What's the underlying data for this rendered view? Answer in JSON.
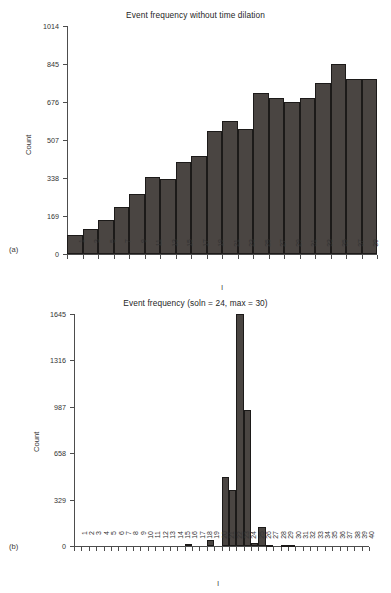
{
  "figure": {
    "background": "#ffffff",
    "bar_color": "#4a4542",
    "bar_edge_color": "#1c1a19",
    "axis_color": "#4d4d4d"
  },
  "panel_a": {
    "label": "(a)",
    "title": "Event frequency without time dilation",
    "xlabel": "l",
    "ylabel": "Count"
  },
  "panel_b": {
    "label": "(b)",
    "title": "Event frequency (soln = 24, max = 30)",
    "xlabel": "l",
    "ylabel": "Count"
  },
  "chart_data": [
    {
      "type": "bar",
      "panel": "(a)",
      "title": "Event frequency without time dilation",
      "xlabel": "l",
      "ylabel": "Count",
      "ylim": [
        0,
        1014
      ],
      "yticks": [
        0,
        169,
        338,
        507,
        676,
        845,
        1014
      ],
      "ytick_labels": [
        "0",
        "169",
        "338",
        "507",
        "676",
        "845",
        "1014"
      ],
      "xticks": [
        1,
        3,
        5,
        7,
        9,
        11,
        13,
        15,
        17,
        19,
        21,
        23,
        25,
        27,
        29,
        31,
        33,
        35,
        37,
        39
      ],
      "xtick_labels": [
        "1",
        "3",
        "5",
        "7",
        "9",
        "11",
        "13",
        "15",
        "17",
        "19",
        "21",
        "23",
        "25",
        "27",
        "29",
        "31",
        "33",
        "35",
        "37",
        "39"
      ],
      "grid": false,
      "legend": null,
      "categories": [
        1,
        3,
        5,
        7,
        9,
        11,
        13,
        15,
        17,
        19,
        21,
        23,
        25,
        27,
        29,
        31,
        33,
        35,
        37,
        39
      ],
      "values": [
        85,
        112,
        150,
        211,
        265,
        343,
        334,
        409,
        435,
        547,
        590,
        556,
        718,
        694,
        678,
        692,
        761,
        847,
        779,
        779
      ],
      "bin_width": 2,
      "bin_starts": [
        1,
        3,
        5,
        7,
        9,
        11,
        13,
        15,
        17,
        19,
        21,
        23,
        25,
        27,
        29,
        31,
        33,
        35,
        37,
        39
      ]
    },
    {
      "type": "bar",
      "panel": "(b)",
      "title": "Event frequency (soln = 24, max = 30)",
      "xlabel": "l",
      "ylabel": "Count",
      "ylim": [
        0,
        1645
      ],
      "yticks": [
        0,
        329,
        658,
        987,
        1316,
        1645
      ],
      "ytick_labels": [
        "0",
        "329",
        "658",
        "987",
        "1316",
        "1645"
      ],
      "xticks": [
        1,
        2,
        3,
        4,
        5,
        6,
        7,
        8,
        9,
        10,
        11,
        12,
        13,
        14,
        15,
        16,
        17,
        18,
        19,
        20,
        21,
        22,
        23,
        24,
        25,
        26,
        27,
        28,
        29,
        30,
        31,
        32,
        33,
        34,
        35,
        36,
        37,
        38,
        39,
        40
      ],
      "xtick_labels": [
        "1",
        "2",
        "3",
        "4",
        "5",
        "6",
        "7",
        "8",
        "9",
        "10",
        "11",
        "12",
        "13",
        "14",
        "15",
        "16",
        "17",
        "18",
        "19",
        "20",
        "21",
        "22",
        "23",
        "24",
        "25",
        "26",
        "27",
        "28",
        "29",
        "30",
        "31",
        "32",
        "33",
        "34",
        "35",
        "36",
        "37",
        "38",
        "39",
        "40"
      ],
      "grid": false,
      "legend": null,
      "annotations": [
        "soln = 24",
        "max = 30"
      ],
      "categories": [
        1,
        2,
        3,
        4,
        5,
        6,
        7,
        8,
        9,
        10,
        11,
        12,
        13,
        14,
        15,
        16,
        17,
        18,
        19,
        20,
        21,
        22,
        23,
        24,
        25,
        26,
        27,
        28,
        29,
        30,
        31,
        32,
        33,
        34,
        35,
        36,
        37,
        38,
        39,
        40
      ],
      "values": [
        0,
        0,
        0,
        0,
        0,
        0,
        0,
        0,
        0,
        0,
        0,
        0,
        0,
        0,
        0,
        14,
        0,
        0,
        40,
        0,
        490,
        395,
        1645,
        967,
        22,
        132,
        10,
        0,
        8,
        8,
        0,
        0,
        0,
        0,
        0,
        0,
        0,
        0,
        0,
        0
      ]
    }
  ]
}
